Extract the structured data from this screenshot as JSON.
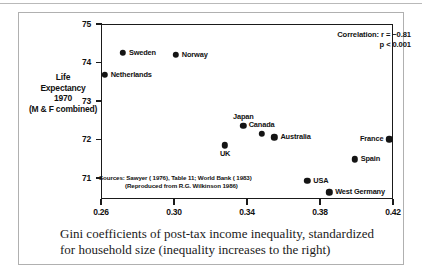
{
  "figure": {
    "caption": "Gini coefficients of post-tax income inequality, standardized for household size (inequality increases to the right)",
    "y_axis_caption_lines": [
      "Life",
      "Expectancy",
      "1970",
      "(M & F combined)"
    ],
    "annotation": {
      "correlation_line": "Correlation:  r = −0.81",
      "p_line": "p < 0.001"
    },
    "sources": {
      "line1": "Sources:  Sawyer ( 1976), Table 11; World Bank ( 1983)",
      "line2": "(Reproduced from R.G. Wilkinson 1986)"
    }
  },
  "chart_data": {
    "type": "scatter",
    "title": "",
    "xlabel": "Gini coefficients of post-tax income inequality, standardized for household size (inequality increases to the right)",
    "ylabel": "Life Expectancy 1970 (M & F combined)",
    "xlim": [
      0.26,
      0.42
    ],
    "ylim": [
      70.45,
      75.0
    ],
    "xticks": [
      0.26,
      0.3,
      0.34,
      0.38,
      0.42
    ],
    "xtick_labels": [
      "0.26",
      "0.30",
      "0.34",
      "0.38",
      "0.42"
    ],
    "yticks": [
      71,
      72,
      73,
      74,
      75
    ],
    "ytick_labels": [
      "71",
      "72",
      "73",
      "74",
      "75"
    ],
    "grid": false,
    "legend": false,
    "correlation_r": -0.81,
    "p_value": "< 0.001",
    "points": [
      {
        "label": "Sweden",
        "x": 0.272,
        "y": 74.25,
        "label_pos": "right"
      },
      {
        "label": "Norway",
        "x": 0.301,
        "y": 74.2,
        "label_pos": "right"
      },
      {
        "label": "Netherlands",
        "x": 0.262,
        "y": 73.68,
        "label_pos": "right"
      },
      {
        "label": "Japan",
        "x": 0.338,
        "y": 72.35,
        "label_pos": "above"
      },
      {
        "label": "Canada",
        "x": 0.348,
        "y": 72.15,
        "label_pos": "above"
      },
      {
        "label": "Australia",
        "x": 0.355,
        "y": 72.05,
        "label_pos": "right"
      },
      {
        "label": "France",
        "x": 0.418,
        "y": 72.0,
        "label_pos": "left"
      },
      {
        "label": "UK",
        "x": 0.328,
        "y": 71.85,
        "label_pos": "below"
      },
      {
        "label": "Spain",
        "x": 0.399,
        "y": 71.48,
        "label_pos": "right"
      },
      {
        "label": "USA",
        "x": 0.373,
        "y": 70.92,
        "label_pos": "right"
      },
      {
        "label": "West Germany",
        "x": 0.385,
        "y": 70.62,
        "label_pos": "right"
      }
    ]
  }
}
